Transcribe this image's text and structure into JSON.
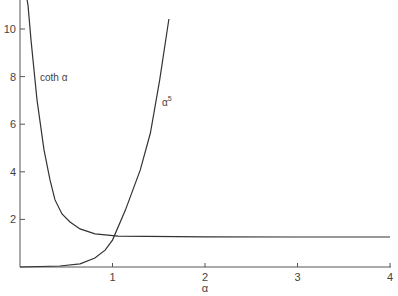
{
  "chart_data": {
    "type": "line",
    "title": "",
    "xlabel": "α",
    "ylabel": "",
    "xlim": [
      0,
      4
    ],
    "ylim": [
      0,
      10.5
    ],
    "grid": false,
    "legend": null,
    "x_ticks": [
      1,
      2,
      3,
      4
    ],
    "y_ticks": [
      2,
      4,
      6,
      8,
      10
    ],
    "annotations": [
      {
        "text": "coth α",
        "x": 0.23,
        "y": 8.0
      },
      {
        "text": "α⁵",
        "x": 1.55,
        "y": 6.8
      }
    ],
    "series": [
      {
        "name": "coth α",
        "x": [
          0.086,
          0.119,
          0.184,
          0.259,
          0.324,
          0.378,
          0.454,
          0.54,
          0.649,
          0.811,
          1.06,
          2.0,
          3.0,
          4.0
        ],
        "y": [
          11.0,
          9.54,
          7.02,
          4.92,
          3.66,
          2.82,
          2.23,
          1.89,
          1.6,
          1.39,
          1.3,
          1.27,
          1.26,
          1.26
        ]
      },
      {
        "name": "α⁵",
        "x": [
          0.0,
          0.43,
          0.65,
          0.81,
          0.92,
          1.0,
          1.14,
          1.3,
          1.41,
          1.51,
          1.61
        ],
        "y": [
          0.0,
          0.04,
          0.13,
          0.38,
          0.71,
          1.13,
          2.39,
          4.08,
          5.63,
          7.86,
          10.42
        ]
      }
    ]
  },
  "axis": {
    "x_label": "α",
    "x_tick_labels": [
      "1",
      "2",
      "3",
      "4"
    ],
    "y_tick_labels": [
      "2",
      "4",
      "6",
      "8",
      "10"
    ]
  },
  "labels": {
    "coth": "coth α",
    "alpha5_base": "α",
    "alpha5_exp": "5"
  },
  "colors": {
    "curve": "#333333",
    "axis": "#555555",
    "text": "#444444"
  }
}
